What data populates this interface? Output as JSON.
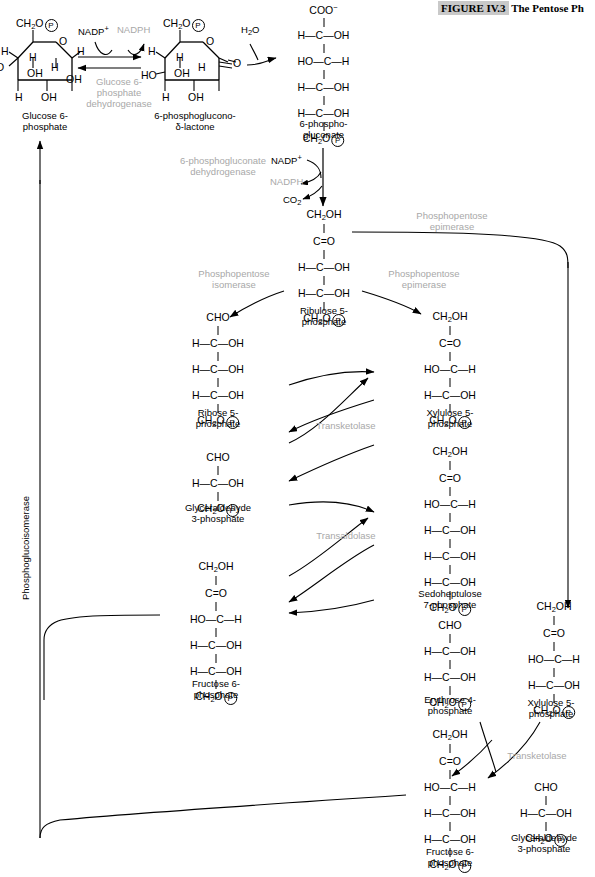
{
  "figure": {
    "number": "FIGURE IV.3",
    "title": "The Pentose Ph"
  },
  "enzymes": {
    "g6pdh": "Glucose 6-\nphosphate\ndehydrogenase",
    "pgdh": "6-phosphogluconate\ndehydrogenase",
    "isomerase": "Phosphopentose\nisomerase",
    "epimerase_mid": "Phosphopentose\nepimerase",
    "epimerase_top": "Phosphopentose\nepimerase",
    "transketolase_1": "Transketolase",
    "transaldolase": "Transaldolase",
    "transketolase_2": "Transketolase",
    "phosphoglucoisomerase": "Phosphoglucoisomerase"
  },
  "cofactors": {
    "nadp_1": "NADP",
    "nadp_1_charge": "+",
    "nadph_1": "NADPH",
    "water": "H",
    "water_sub": "2",
    "water_end": "O",
    "nadp_2": "NADP",
    "nadp_2_charge": "+",
    "nadph_2": "NADPH",
    "co2": "CO",
    "co2_sub": "2"
  },
  "molecules": {
    "glucose6p": {
      "name": "Glucose 6-\nphosphate"
    },
    "lactone": {
      "name": "6-phosphoglucono-\nδ-lactone"
    },
    "gluconate6p": {
      "name": "6-phospho-\ngluconate",
      "rows": [
        "COO⁻",
        "H—C—OH",
        "HO—C—H",
        "H—C—OH",
        "H—C—OH",
        "CH2O P"
      ]
    },
    "ribulose5p": {
      "name": "Ribulose 5-\nphosphate",
      "rows": [
        "CH2OH",
        "C=O",
        "H—C—OH",
        "H—C—OH",
        "CH2O P"
      ]
    },
    "ribose5p": {
      "name": "Ribose 5-\nphosphate",
      "rows": [
        "CHO",
        "H—C—OH",
        "H—C—OH",
        "H—C—OH",
        "CH2O P"
      ]
    },
    "xylulose5p_a": {
      "name": "Xylulose 5-\nphosphate",
      "rows": [
        "CH2OH",
        "C=O",
        "HO—C—H",
        "H—C—OH",
        "CH2O P"
      ]
    },
    "gap_a": {
      "name": "Glyceraldehyde\n3-phosphate",
      "rows": [
        "CHO",
        "H—C—OH",
        "CH2O P"
      ]
    },
    "sedoheptulose7p": {
      "name": "Sedoheptulose\n7-phosphate",
      "rows": [
        "CH2OH",
        "C=O",
        "HO—C—H",
        "H—C—OH",
        "H—C—OH",
        "H—C—OH",
        "CH2O P"
      ]
    },
    "fructose6p_a": {
      "name": "Fructose 6-\nphosphate",
      "rows": [
        "CH2OH",
        "C=O",
        "HO—C—H",
        "H—C—OH",
        "H—C—OH",
        "CH2O P"
      ]
    },
    "erythrose4p": {
      "name": "Erythrose 4-\nphosphate",
      "rows": [
        "CHO",
        "H—C—OH",
        "H—C—OH",
        "CH2O P"
      ]
    },
    "xylulose5p_b": {
      "name": "Xylulose 5-\nphosphate",
      "rows": [
        "CH2OH",
        "C=O",
        "HO—C—H",
        "H—C—OH",
        "CH2O P"
      ]
    },
    "fructose6p_b": {
      "name": "Fructose 6-\nphosphate",
      "rows": [
        "CH2OH",
        "C=O",
        "HO—C—H",
        "H—C—OH",
        "H—C—OH",
        "CH2O P"
      ]
    },
    "gap_b": {
      "name": "Glyceraldehyde\n3-phosphate",
      "rows": [
        "CHO",
        "H—C—OH",
        "CH2O P"
      ]
    }
  },
  "ring_labels": {
    "glucose": [
      "CH2O P",
      "O",
      "H",
      "H",
      "H",
      "H",
      "OH",
      "OH",
      "OH",
      "OH",
      "H"
    ],
    "lactone": [
      "CH2O P",
      "O",
      "H",
      "H",
      "HO",
      "OH",
      "H",
      "H",
      "OH",
      "O"
    ]
  },
  "colors": {
    "ink": "#000000",
    "enzyme_grey": "#a8a8a8",
    "title_highlight": "#c9c9c9"
  }
}
